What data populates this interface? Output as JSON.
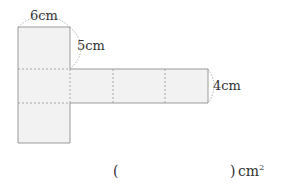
{
  "figure": {
    "type": "net-of-rectangular-prism",
    "labels": {
      "top_width": "6cm",
      "height": "5cm",
      "strip_height": "4cm"
    },
    "colors": {
      "face_fill": "#f2f2f2",
      "outline": "#9a9a9a",
      "fold_line": "#a8a8a8",
      "arc": "#9a9a9a",
      "text": "#333333"
    }
  },
  "answer": {
    "open_paren": "(",
    "close_paren": ")",
    "unit": "cm",
    "unit_power": "2",
    "value": ""
  }
}
